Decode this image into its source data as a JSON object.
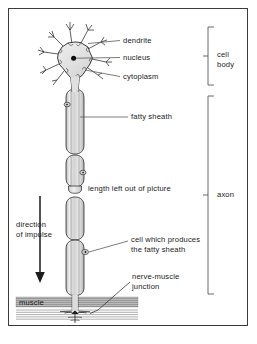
{
  "figure": {
    "background_color": "#ffffff",
    "frame_color": "#3a3a42",
    "ink_color": "#1a1a1a",
    "cell_fill": "#e2e2e2",
    "axon_fill": "#dcdcdc",
    "muscle_fill": "#c9c9c9"
  },
  "labels": {
    "dendrite": "dendrite",
    "nucleus": "nucleus",
    "cytoplasm": "cytoplasm",
    "fatty_sheath": "fatty sheath",
    "length_left_out": "length left out of picture",
    "direction_line1": "direction",
    "direction_line2": "of impulse",
    "schwann_line1": "cell which produces",
    "schwann_line2": "the fatty sheath",
    "junction_line1": "nerve-muscle",
    "junction_line2": "junction",
    "muscle": "muscle"
  },
  "brackets": {
    "cell_body_line1": "cell",
    "cell_body_line2": "body",
    "axon": "axon"
  }
}
